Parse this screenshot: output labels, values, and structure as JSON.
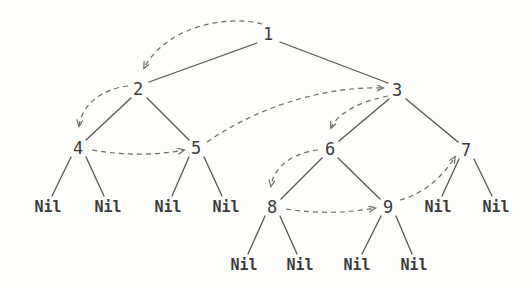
{
  "diagram": {
    "background_color": "#fdfdfc",
    "node_text_color": "#3b3b3b",
    "edge_color": "#555555",
    "arrow_color": "#6a6a6a"
  },
  "nodes": [
    {
      "id": "n1",
      "label": "1",
      "x": 268,
      "y": 34
    },
    {
      "id": "n2",
      "label": "2",
      "x": 138,
      "y": 89
    },
    {
      "id": "n3",
      "label": "3",
      "x": 397,
      "y": 90
    },
    {
      "id": "n4",
      "label": "4",
      "x": 78,
      "y": 148
    },
    {
      "id": "n5",
      "label": "5",
      "x": 196,
      "y": 148
    },
    {
      "id": "n6",
      "label": "6",
      "x": 330,
      "y": 149
    },
    {
      "id": "n7",
      "label": "7",
      "x": 466,
      "y": 150
    },
    {
      "id": "n8",
      "label": "8",
      "x": 272,
      "y": 207
    },
    {
      "id": "n9",
      "label": "9",
      "x": 388,
      "y": 207
    }
  ],
  "leaves": [
    {
      "id": "l1",
      "label": "Nil",
      "x": 48,
      "y": 207,
      "parent": "n4"
    },
    {
      "id": "l2",
      "label": "Nil",
      "x": 108,
      "y": 207,
      "parent": "n4"
    },
    {
      "id": "l3",
      "label": "Nil",
      "x": 168,
      "y": 207,
      "parent": "n5"
    },
    {
      "id": "l4",
      "label": "Nil",
      "x": 226,
      "y": 207,
      "parent": "n5"
    },
    {
      "id": "l5",
      "label": "Nil",
      "x": 438,
      "y": 207,
      "parent": "n7"
    },
    {
      "id": "l6",
      "label": "Nil",
      "x": 496,
      "y": 207,
      "parent": "n7"
    },
    {
      "id": "l7",
      "label": "Nil",
      "x": 244,
      "y": 265,
      "parent": "n8"
    },
    {
      "id": "l8",
      "label": "Nil",
      "x": 300,
      "y": 265,
      "parent": "n8"
    },
    {
      "id": "l9",
      "label": "Nil",
      "x": 357,
      "y": 265,
      "parent": "n9"
    },
    {
      "id": "l10",
      "label": "Nil",
      "x": 414,
      "y": 265,
      "parent": "n9"
    }
  ],
  "tree_edges": [
    {
      "from": "n1",
      "to": "n2",
      "x1": 257,
      "y1": 43,
      "x2": 149,
      "y2": 82
    },
    {
      "from": "n1",
      "to": "n3",
      "x1": 280,
      "y1": 42,
      "x2": 388,
      "y2": 83
    },
    {
      "from": "n2",
      "to": "n4",
      "x1": 131,
      "y1": 98,
      "x2": 86,
      "y2": 140
    },
    {
      "from": "n2",
      "to": "n5",
      "x1": 147,
      "y1": 98,
      "x2": 189,
      "y2": 140
    },
    {
      "from": "n3",
      "to": "n6",
      "x1": 389,
      "y1": 99,
      "x2": 339,
      "y2": 141
    },
    {
      "from": "n3",
      "to": "n7",
      "x1": 406,
      "y1": 99,
      "x2": 458,
      "y2": 142
    },
    {
      "from": "n4",
      "to": "l1",
      "x1": 71,
      "y1": 157,
      "x2": 52,
      "y2": 196
    },
    {
      "from": "n4",
      "to": "l2",
      "x1": 86,
      "y1": 157,
      "x2": 104,
      "y2": 196
    },
    {
      "from": "n5",
      "to": "l3",
      "x1": 189,
      "y1": 157,
      "x2": 172,
      "y2": 196
    },
    {
      "from": "n5",
      "to": "l4",
      "x1": 204,
      "y1": 157,
      "x2": 222,
      "y2": 196
    },
    {
      "from": "n6",
      "to": "n8",
      "x1": 322,
      "y1": 158,
      "x2": 281,
      "y2": 199
    },
    {
      "from": "n6",
      "to": "n9",
      "x1": 338,
      "y1": 158,
      "x2": 380,
      "y2": 199
    },
    {
      "from": "n7",
      "to": "l5",
      "x1": 459,
      "y1": 159,
      "x2": 442,
      "y2": 196
    },
    {
      "from": "n7",
      "to": "l6",
      "x1": 474,
      "y1": 159,
      "x2": 492,
      "y2": 196
    },
    {
      "from": "n8",
      "to": "l7",
      "x1": 265,
      "y1": 216,
      "x2": 248,
      "y2": 254
    },
    {
      "from": "n8",
      "to": "l8",
      "x1": 280,
      "y1": 216,
      "x2": 297,
      "y2": 254
    },
    {
      "from": "n9",
      "to": "l9",
      "x1": 381,
      "y1": 216,
      "x2": 362,
      "y2": 254
    },
    {
      "from": "n9",
      "to": "l10",
      "x1": 396,
      "y1": 216,
      "x2": 412,
      "y2": 254
    }
  ],
  "traversal_arrows": [
    {
      "from": "n1",
      "to": "n2",
      "path": "M 262,24 C 225,14 165,28 144,68",
      "order": 1
    },
    {
      "from": "n2",
      "to": "n4",
      "path": "M 128,86 C 101,89 82,105 79,126",
      "order": 2
    },
    {
      "from": "n4",
      "to": "n5",
      "path": "M 92,150 C 127,156 158,155 184,150",
      "order": 3
    },
    {
      "from": "n5",
      "to": "n3",
      "path": "M 207,142 C 262,104 330,86 383,88",
      "order": 4
    },
    {
      "from": "n3",
      "to": "n6",
      "path": "M 388,96 C 362,101 338,112 331,128",
      "order": 5
    },
    {
      "from": "n6",
      "to": "n8",
      "path": "M 318,150 C 293,153 274,166 271,186",
      "order": 6
    },
    {
      "from": "n8",
      "to": "n9",
      "path": "M 286,209 C 318,214 348,213 375,208",
      "order": 7
    },
    {
      "from": "n9",
      "to": "n7",
      "path": "M 400,200 C 424,194 443,176 455,157",
      "order": 8
    }
  ]
}
